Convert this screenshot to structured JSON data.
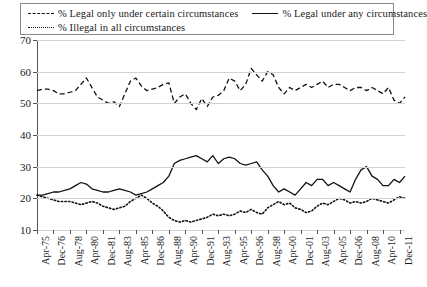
{
  "legend": {
    "entries": [
      {
        "label": "% Legal only under certain circumstances",
        "style": "dashed",
        "icon": "dashed-line-swatch"
      },
      {
        "label": "% Legal under any circumstances",
        "style": "solid",
        "icon": "solid-line-swatch"
      },
      {
        "label": "% Illegal in all circumstances",
        "style": "dotted",
        "icon": "dotted-line-swatch"
      }
    ]
  },
  "axes": {
    "y_ticks": [
      "70",
      "60",
      "50",
      "40",
      "30",
      "20",
      "10"
    ],
    "x_ticks": [
      "Apr-75",
      "Dec-76",
      "Aug-78",
      "Apr-80",
      "Dec-81",
      "Aug-83",
      "Apr-85",
      "Dec-86",
      "Aug-88",
      "Apr-90",
      "Dec-91",
      "Aug-93",
      "Apr-95",
      "Dec-96",
      "Aug-98",
      "Apr-00",
      "Dec-01",
      "Aug-03",
      "Apr-05",
      "Dec-06",
      "Aug-08",
      "Apr-10",
      "Dec-11"
    ]
  },
  "chart_data": {
    "type": "line",
    "title": "",
    "xlabel": "",
    "ylabel": "",
    "ylim": [
      10,
      70
    ],
    "grid": true,
    "legend_position": "top",
    "x_tick_labels": [
      "Apr-75",
      "Dec-76",
      "Aug-78",
      "Apr-80",
      "Dec-81",
      "Aug-83",
      "Apr-85",
      "Dec-86",
      "Aug-88",
      "Apr-90",
      "Dec-91",
      "Aug-93",
      "Apr-95",
      "Dec-96",
      "Aug-98",
      "Apr-00",
      "Dec-01",
      "Aug-03",
      "Apr-05",
      "Dec-06",
      "Aug-08",
      "Apr-10",
      "Dec-11"
    ],
    "x_tick_positions": [
      0,
      3,
      6,
      9,
      12,
      15,
      18,
      21,
      24,
      27,
      30,
      33,
      36,
      39,
      42,
      45,
      48,
      51,
      54,
      57,
      60,
      63,
      66
    ],
    "n_points": 68,
    "series": [
      {
        "name": "% Legal only under certain circumstances",
        "style": "dashed",
        "color": "#111111",
        "values": [
          54,
          54.5,
          54.5,
          54,
          53,
          53,
          53.5,
          54,
          56,
          58,
          55,
          52,
          51,
          50,
          50.5,
          49,
          53,
          57,
          58,
          55.5,
          54,
          54.5,
          55,
          56,
          56.5,
          50,
          52,
          53,
          50,
          48,
          51.5,
          49,
          52,
          52.5,
          54,
          58,
          57,
          54,
          56,
          61,
          59,
          57,
          60,
          59,
          55,
          53,
          55,
          54,
          55,
          56,
          55,
          56,
          57,
          55,
          56,
          56,
          55,
          54,
          55,
          55,
          54,
          55,
          54,
          53,
          55,
          51,
          50,
          52
        ]
      },
      {
        "name": "% Legal under any circumstances",
        "style": "solid",
        "color": "#111111",
        "values": [
          21,
          21,
          21.5,
          22,
          22,
          22.5,
          23,
          24,
          25,
          24.5,
          23,
          22.5,
          22,
          22,
          22.5,
          23,
          22.5,
          22,
          21,
          21.5,
          22,
          23,
          24,
          25,
          27,
          31,
          32,
          32.5,
          33,
          33.5,
          32.5,
          31.5,
          33.5,
          31,
          32.5,
          33,
          32.5,
          31,
          30.5,
          31,
          31.5,
          29,
          27,
          24,
          22,
          23,
          22,
          21,
          23,
          25,
          24,
          26,
          26,
          24,
          25,
          24,
          23,
          22,
          26,
          29,
          30,
          27,
          26,
          24,
          24,
          26,
          25,
          27
        ]
      },
      {
        "name": "% Illegal in all circumstances",
        "style": "dotted",
        "color": "#111111",
        "values": [
          21,
          20.5,
          20,
          19.5,
          19,
          19,
          19,
          18.5,
          18,
          18.5,
          19,
          18.5,
          17.5,
          17,
          16.5,
          17,
          17.5,
          19,
          20,
          21,
          20,
          18.5,
          17.5,
          16,
          14,
          13,
          12.5,
          13,
          12.5,
          13,
          13.5,
          14,
          15,
          14.5,
          15,
          14.5,
          15,
          16,
          15.5,
          16.5,
          15.5,
          15,
          17,
          18,
          19,
          18,
          18.5,
          17,
          16.5,
          15.5,
          16,
          17.5,
          18.5,
          18,
          19,
          20,
          19.5,
          18.5,
          19,
          18.5,
          19,
          20,
          19.5,
          19,
          18.5,
          19.5,
          20.5,
          20
        ]
      }
    ]
  }
}
